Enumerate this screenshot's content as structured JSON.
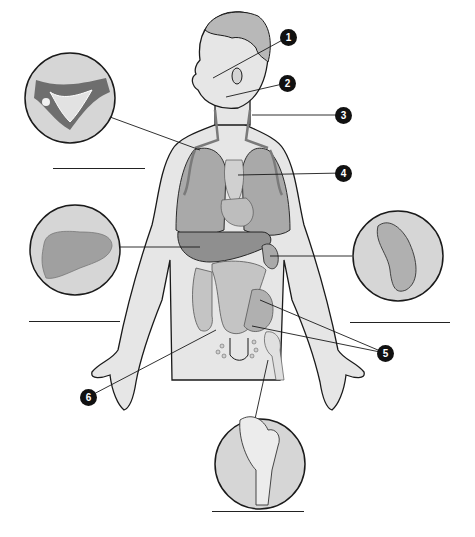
{
  "diagram": {
    "type": "anatomical-worksheet",
    "colors": {
      "skin": "#e6e6e6",
      "organ": "#a9a9a9",
      "organ_dark": "#8f8f8f",
      "outline": "#1a1a1a",
      "inset_bg": "#d6d6d6",
      "callout_fill": "#111111",
      "callout_text": "#ffffff"
    },
    "callouts": [
      {
        "number": "1",
        "x": 288,
        "y": 37,
        "target": "face"
      },
      {
        "number": "2",
        "x": 287,
        "y": 83,
        "target": "neck-lymph-node"
      },
      {
        "number": "3",
        "x": 343,
        "y": 115,
        "target": "neck"
      },
      {
        "number": "4",
        "x": 343,
        "y": 173,
        "target": "thymus"
      },
      {
        "number": "5",
        "x": 385,
        "y": 353,
        "target": "intestines"
      },
      {
        "number": "6",
        "x": 88,
        "y": 397,
        "target": "appendix"
      }
    ],
    "insets": [
      {
        "name": "lymph-vessel-inset",
        "cx": 70,
        "cy": 98,
        "r": 45
      },
      {
        "name": "liver-inset",
        "cx": 75,
        "cy": 250,
        "r": 45
      },
      {
        "name": "spleen-inset",
        "cx": 398,
        "cy": 256,
        "r": 45
      },
      {
        "name": "bone-marrow-inset",
        "cx": 260,
        "cy": 464,
        "r": 45
      }
    ],
    "answer_lines": [
      {
        "name": "answer-line-lymph-vessel",
        "x1": 53,
        "x2": 145,
        "y": 168
      },
      {
        "name": "answer-line-liver",
        "x1": 29,
        "x2": 120,
        "y": 321
      },
      {
        "name": "answer-line-spleen",
        "x1": 350,
        "x2": 450,
        "y": 322
      },
      {
        "name": "answer-line-bone-marrow",
        "x1": 212,
        "x2": 304,
        "y": 511
      }
    ]
  }
}
